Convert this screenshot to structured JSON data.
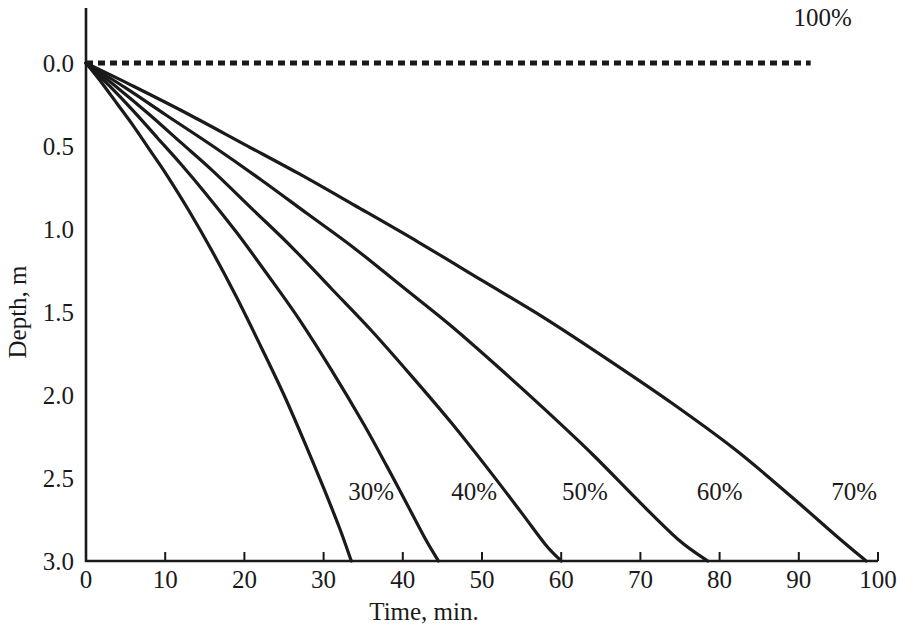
{
  "chart_data": {
    "type": "line",
    "title": "",
    "xlabel": "Time, min.",
    "ylabel": "Depth, m",
    "xlim": [
      0,
      100
    ],
    "ylim": [
      0,
      3.0
    ],
    "y_inverted": true,
    "grid": false,
    "legend_position": "inline-annotations",
    "xticks": [
      0,
      10,
      20,
      30,
      40,
      50,
      60,
      70,
      80,
      90,
      100
    ],
    "xtick_labels": [
      "0",
      "10",
      "20",
      "30",
      "40",
      "50",
      "60",
      "70",
      "80",
      "90",
      "100"
    ],
    "yticks": [
      0.0,
      0.5,
      1.0,
      1.5,
      2.0,
      2.5,
      3.0
    ],
    "ytick_labels": [
      "0.0",
      "0.5",
      "1.0",
      "1.5",
      "2.0",
      "2.5",
      "3.0"
    ],
    "series": [
      {
        "name": "30%",
        "label": "30%",
        "style": "solid",
        "x": [
          0,
          2,
          4,
          6,
          8,
          10,
          13,
          16,
          19,
          22,
          25,
          28,
          30,
          32,
          33.5
        ],
        "y": [
          0.0,
          0.12,
          0.25,
          0.38,
          0.52,
          0.66,
          0.89,
          1.14,
          1.41,
          1.7,
          2.0,
          2.33,
          2.56,
          2.8,
          3.0
        ]
      },
      {
        "name": "40%",
        "label": "40%",
        "style": "solid",
        "x": [
          0,
          3,
          6,
          9,
          12,
          15,
          19,
          23,
          27,
          31,
          35,
          38,
          41,
          43,
          44.5
        ],
        "y": [
          0.0,
          0.14,
          0.29,
          0.45,
          0.61,
          0.78,
          1.02,
          1.28,
          1.55,
          1.85,
          2.17,
          2.43,
          2.7,
          2.88,
          3.0
        ]
      },
      {
        "name": "50%",
        "label": "50%",
        "style": "solid",
        "x": [
          0,
          4,
          8,
          12,
          16,
          21,
          26,
          31,
          36,
          41,
          46,
          51,
          55,
          58,
          60
        ],
        "y": [
          0.0,
          0.15,
          0.31,
          0.48,
          0.65,
          0.88,
          1.11,
          1.36,
          1.61,
          1.88,
          2.16,
          2.46,
          2.71,
          2.9,
          3.0
        ]
      },
      {
        "name": "60%",
        "label": "60%",
        "style": "solid",
        "x": [
          0,
          5,
          10,
          16,
          22,
          28,
          34,
          40,
          46,
          52,
          58,
          64,
          70,
          75,
          78.5
        ],
        "y": [
          0.0,
          0.15,
          0.31,
          0.5,
          0.7,
          0.91,
          1.12,
          1.35,
          1.58,
          1.83,
          2.09,
          2.36,
          2.65,
          2.88,
          3.0
        ]
      },
      {
        "name": "70%",
        "label": "70%",
        "style": "solid",
        "x": [
          0,
          6,
          13,
          20,
          27,
          34,
          42,
          50,
          58,
          66,
          74,
          82,
          89,
          95,
          98.5
        ],
        "y": [
          0.0,
          0.14,
          0.31,
          0.49,
          0.67,
          0.86,
          1.08,
          1.31,
          1.54,
          1.79,
          2.05,
          2.33,
          2.61,
          2.86,
          3.0
        ]
      },
      {
        "name": "100%",
        "label": "100%",
        "style": "dashed",
        "x": [
          0,
          91.5
        ],
        "y": [
          0.0,
          0.0
        ]
      }
    ],
    "annotations": [
      {
        "text": "30%",
        "x": 36,
        "y": 2.58
      },
      {
        "text": "40%",
        "x": 49,
        "y": 2.58
      },
      {
        "text": "50%",
        "x": 63,
        "y": 2.58
      },
      {
        "text": "60%",
        "x": 80,
        "y": 2.58
      },
      {
        "text": "70%",
        "x": 97,
        "y": 2.58
      },
      {
        "text": "100%",
        "x": 93,
        "y": -0.28
      }
    ],
    "colors": {
      "curve": "#1a1a1a",
      "axis": "#1a1a1a",
      "text": "#1a1a1a",
      "background": "#ffffff"
    }
  }
}
